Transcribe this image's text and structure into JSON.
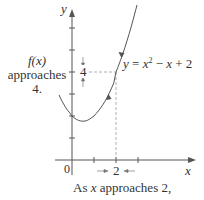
{
  "figure": {
    "function_label": "y = x² − x + 2",
    "function_label_parts": {
      "lhs": "y",
      "eq": " = ",
      "x1": "x",
      "sup": "2",
      "rest1": " − ",
      "x2": "x",
      "rest2": " + 2"
    },
    "axis_x_label": "x",
    "axis_y_label": "y",
    "origin_label": "0",
    "x_marker_value": "2",
    "y_marker_value": "4",
    "left_caption": {
      "line1": "f(x)",
      "line2": "approaches",
      "line3": "4."
    },
    "bottom_caption": {
      "pre": "As ",
      "var": "x",
      "post": " approaches 2,"
    },
    "colors": {
      "curve": "#555555",
      "axis": "#555555",
      "dashed": "#999999",
      "text": "#333333"
    }
  }
}
